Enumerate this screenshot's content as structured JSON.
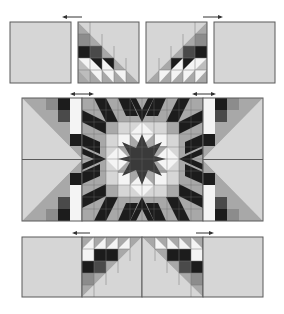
{
  "diagram": {
    "colors": {
      "background": "#d6d6d6",
      "light": "#bdbdbd",
      "white": "#f4f4f4",
      "medium": "#a8a8a8",
      "dark": "#1c1c1c",
      "darkgray": "#4a4a4a",
      "center": "#3a3a3a",
      "outline": "#5a5a5a",
      "arrow": "#333333"
    },
    "rows": [
      {
        "name": "top-row",
        "pieces": [
          "plain-square",
          "left-diamond-corner",
          "right-diamond-corner",
          "plain-square"
        ],
        "arrows": [
          "left",
          "right"
        ]
      },
      {
        "name": "middle-row",
        "pieces": [
          "left-setting-triangles",
          "center-star-block",
          "right-setting-triangles"
        ],
        "arrows": [
          "both",
          "both"
        ]
      },
      {
        "name": "bottom-row",
        "pieces": [
          "plain-square",
          "left-diamond-corner",
          "right-diamond-corner",
          "plain-square"
        ],
        "arrows": [
          "left",
          "right"
        ]
      }
    ]
  }
}
